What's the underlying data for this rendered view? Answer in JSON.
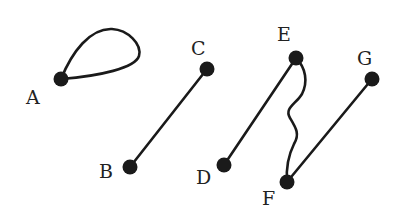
{
  "diagram": {
    "type": "graph",
    "colors": {
      "stroke": "#1a1a1a",
      "label": "#222222",
      "background": "#ffffff"
    },
    "nodes": [
      {
        "id": "A",
        "label": "A",
        "x": 61,
        "y": 79
      },
      {
        "id": "B",
        "label": "B",
        "x": 130,
        "y": 167
      },
      {
        "id": "C",
        "label": "C",
        "x": 207,
        "y": 69
      },
      {
        "id": "D",
        "label": "D",
        "x": 224,
        "y": 165
      },
      {
        "id": "E",
        "label": "E",
        "x": 296,
        "y": 58
      },
      {
        "id": "F",
        "label": "F",
        "x": 287,
        "y": 182
      },
      {
        "id": "G",
        "label": "G",
        "x": 372,
        "y": 79
      }
    ],
    "edges": [
      {
        "from": "A",
        "to": "A",
        "kind": "loop"
      },
      {
        "from": "B",
        "to": "C",
        "kind": "straight"
      },
      {
        "from": "D",
        "to": "E",
        "kind": "straight"
      },
      {
        "from": "E",
        "to": "F",
        "kind": "wavy"
      },
      {
        "from": "F",
        "to": "G",
        "kind": "straight"
      }
    ]
  }
}
